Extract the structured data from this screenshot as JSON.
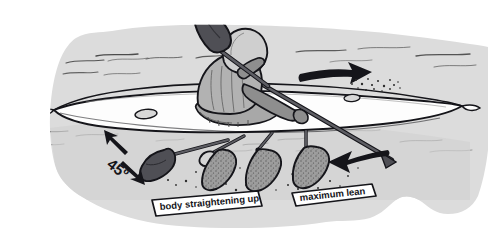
{
  "illustration": {
    "title": "Kayak sculling / low brace recovery sequence",
    "subject": "kayaker performing a lean with paddle brace sequence",
    "width": 491,
    "height": 244,
    "background_color": "#ffffff",
    "water_color": "#dcdcdc",
    "outline_color": "#15151a"
  },
  "labels": {
    "body_straightening": "body straightening up",
    "maximum_lean": "maximum lean",
    "angle": "45º"
  },
  "colors": {
    "water": "#dcdcdc",
    "water_shadow": "#cfcfcf",
    "hull_white": "#fdfdfd",
    "outline": "#15151a",
    "blade_dark": "#4f4f55",
    "blade_stipple": "#9a9a9a",
    "helmet": "#cfcfcf",
    "torso": "#b2b2b2",
    "arm": "#8e8e8e",
    "spraydeck": "#a8a8a8",
    "banner_fill": "#ffffff",
    "arrow_fill": "#15151a"
  },
  "elements": {
    "paddler": {
      "name": "kayaker",
      "helmet": "light gray helmet",
      "torso": "mid gray lifejacket",
      "arms": "dark gray arms",
      "pose": "leaning with paddle braced low on the right"
    },
    "kayak": {
      "name": "sea kayak",
      "hull": "white hull with black outline",
      "deck_hatches": 2
    },
    "paddle": {
      "raised_blade": "dark charcoal blade raised upper-left",
      "shaft": "dark shaft crossing body to lower right"
    },
    "blade_sequence": {
      "count": 4,
      "description": "four blade positions showing the sculling recovery sweep",
      "styles": [
        "solid-dark",
        "stippled",
        "stippled",
        "stippled"
      ]
    },
    "arrows": [
      {
        "name": "direction-of-travel-arrow",
        "direction": "right",
        "location": "above bow"
      },
      {
        "name": "paddle-sweep-arrow",
        "direction": "left",
        "location": "lower right"
      },
      {
        "name": "angle-arrow-up",
        "direction": "up-left",
        "location": "left of 45 degree label"
      },
      {
        "name": "angle-arrow-down",
        "direction": "down-right",
        "location": "right of 45 degree label"
      }
    ],
    "ripples": "thin horizontal wavy water lines",
    "splash": "stipple spray at bow"
  }
}
